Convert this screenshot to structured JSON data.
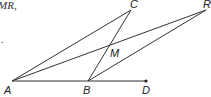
{
  "fragment_text": {
    "top_left": "MR,",
    "mid_left": "."
  },
  "diagram": {
    "points": {
      "A": {
        "label": "A",
        "x": 12,
        "y": 81
      },
      "B": {
        "label": "B",
        "x": 88,
        "y": 81
      },
      "D": {
        "label": "D",
        "x": 146,
        "y": 81
      },
      "C": {
        "label": "C",
        "x": 131,
        "y": 10
      },
      "R": {
        "label": "R",
        "x": 206,
        "y": 10
      },
      "M": {
        "label": "M",
        "x": 110,
        "y": 44
      }
    },
    "segments": [
      [
        "A",
        "D"
      ],
      [
        "A",
        "C"
      ],
      [
        "B",
        "C"
      ],
      [
        "A",
        "R"
      ],
      [
        "B",
        "R"
      ]
    ],
    "dot_point": "D",
    "stroke_color": "#333333"
  }
}
